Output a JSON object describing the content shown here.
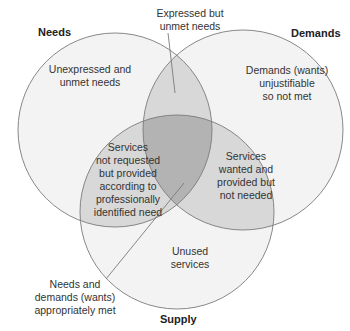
{
  "diagram": {
    "type": "venn",
    "colors": {
      "background": "#ffffff",
      "single": "#f3f3f3",
      "pair": "#d8d8d8",
      "triple": "#b3b3b3",
      "stroke": "#7a7a7a",
      "text": "#333333"
    },
    "sets": [
      {
        "id": "needs",
        "title": "Needs"
      },
      {
        "id": "demands",
        "title": "Demands"
      },
      {
        "id": "supply",
        "title": "Supply"
      }
    ],
    "regions": {
      "needs_only": "Unexpressed and\nunmet needs",
      "demands_only": "Demands (wants)\nunjustifiable\nso not met",
      "supply_only": "Unused\nservices",
      "needs_demands": "Expressed but\nunmet needs",
      "needs_supply": "Services\nnot requested\nbut provided\naccording to\nprofessionally\nidentified need",
      "demands_supply": "Services\nwanted and\nprovided but\nnot needed",
      "all_three": "Needs and\ndemands (wants)\nappropriately met"
    }
  }
}
